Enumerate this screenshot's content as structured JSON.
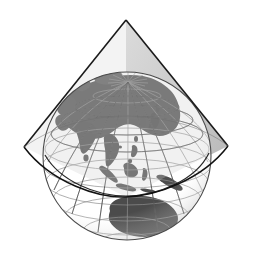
{
  "figure": {
    "title": "Conic projection developable surface over a globe",
    "caption": "",
    "background_color": "#ffffff",
    "width": 253,
    "height": 258,
    "type": "cartographic-diagram"
  },
  "colors": {
    "background": "#ffffff",
    "ocean": "#ffffff",
    "land": "#555555",
    "land_shaded": "#6b6b6b",
    "graticule": "#8a8a8a",
    "graticule_on_land": "#2d2d2d",
    "globe_outline": "#4a4a4a",
    "cone_edge": "#1a1a1a",
    "cone_surface": "#c9c9c9",
    "cone_surface_dark": "#b3b3b3",
    "standard_parallel": "#111111"
  },
  "globe": {
    "name": "earth-globe",
    "center_x": 127,
    "center_y": 156,
    "radius": 84,
    "projection": "orthographic",
    "center_longitude_deg": 115,
    "center_latitude_deg": 30,
    "graticule_spacing_deg": 15,
    "pole_visible": "north",
    "north_pole_x": 128,
    "north_pole_y": 82,
    "visible_regions": [
      "Asia",
      "Siberia",
      "China",
      "India",
      "Arabian Peninsula",
      "Japan",
      "Southeast Asia",
      "Philippines",
      "Indonesia",
      "New Guinea",
      "Australia",
      "Arctic Ocean",
      "Greenland edge",
      "Europe edge"
    ]
  },
  "cone": {
    "name": "projection-cone",
    "apex_x": 126,
    "apex_y": 20,
    "left_vertex_x": 24,
    "left_vertex_y": 147,
    "right_vertex_x": 228,
    "right_vertex_y": 146,
    "base_arc_center_x": 126,
    "base_arc_center_y": 148,
    "base_arc_sag_y": 197,
    "half_angle_deg": 39,
    "surface_opacity": 0.55
  },
  "standard_parallel": {
    "name": "standard-parallel",
    "latitude_deg": 0,
    "label": ""
  },
  "legend": {
    "visible": false,
    "items": []
  },
  "annotations": []
}
